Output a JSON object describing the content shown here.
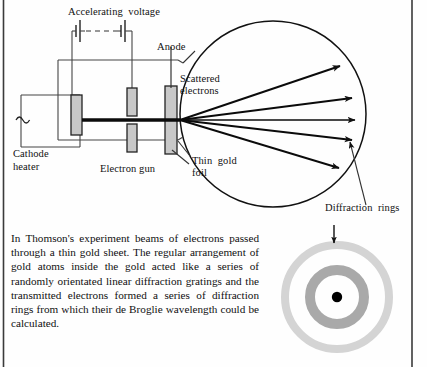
{
  "figure": {
    "labels": {
      "accelerating_voltage": "Accelerating  voltage",
      "anode": "Anode",
      "scattered_electrons_line1": "Scattered",
      "scattered_electrons_line2": "electrons",
      "thin_gold_foil_line1": "Thin  gold",
      "thin_gold_foil_line2": "foil",
      "cathode_heater_line1": "Cathode",
      "cathode_heater_line2": "heater",
      "electron_gun": "Electron gun",
      "diffraction_rings": "Diffraction  rings"
    },
    "caption": "In Thomson's experiment beams of electrons passed through a thin gold sheet. The regular arrangement of gold atoms inside the gold acted like a series of randomly orientated linear diffraction gratings and the transmitted electrons formed a series of diffraction rings from which their de Broglie wavelength could be calculated.",
    "colors": {
      "ink": "#111111",
      "electrode_fill": "#c8c8c8",
      "ring_outer": "#d2d2d2",
      "ring_inner": "#a8a8a8",
      "center_dot": "#000000",
      "border": "#3a3a3a",
      "background": "#fefefe"
    },
    "vacuum_chamber": {
      "shape": "circle",
      "center_x": 273,
      "center_y": 114,
      "radius": 93
    },
    "scattered_beams": {
      "count": 5,
      "origin_x": 180,
      "origin_y": 120,
      "tip_points": [
        [
          340,
          66
        ],
        [
          352,
          98
        ],
        [
          355,
          120
        ],
        [
          352,
          140
        ],
        [
          339,
          168
        ]
      ]
    },
    "diffraction_pattern": {
      "center_x": 337,
      "center_y": 297,
      "outer_ring_radius": 52,
      "outer_ring_width": 8,
      "inner_ring_radius": 27,
      "inner_ring_width": 10,
      "center_dot_radius": 5
    },
    "battery_cells": 2,
    "ac_source_symbol": "~"
  }
}
